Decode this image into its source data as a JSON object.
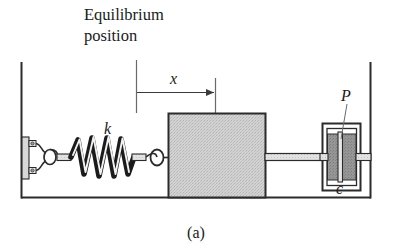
{
  "figure": {
    "caption": "(a)",
    "title_line_1": "Equilibrium",
    "title_line_2": "position",
    "labels": {
      "spring": "k",
      "displacement": "x",
      "piston": "P",
      "damper": "c"
    },
    "colors": {
      "line": "#2b2b2b",
      "mass_fill": "#c9c9c9",
      "piston_fill": "#8c8c8c",
      "cylinder_fill": "#ffffff",
      "wall": "#2b2b2b",
      "dimension_line": "#555555",
      "background": "#ffffff"
    },
    "components": [
      {
        "name": "left-wall",
        "label": ""
      },
      {
        "name": "right-wall",
        "label": ""
      },
      {
        "name": "floor",
        "label": ""
      },
      {
        "name": "wall-bracket",
        "label": ""
      },
      {
        "name": "spring",
        "label": "k"
      },
      {
        "name": "mass-block",
        "label": ""
      },
      {
        "name": "connecting-rod",
        "label": ""
      },
      {
        "name": "dashpot-cylinder",
        "label": "c"
      },
      {
        "name": "dashpot-piston",
        "label": "P"
      },
      {
        "name": "displacement-arrow",
        "label": "x"
      },
      {
        "name": "equilibrium-reference-line",
        "label": "Equilibrium position"
      }
    ]
  }
}
